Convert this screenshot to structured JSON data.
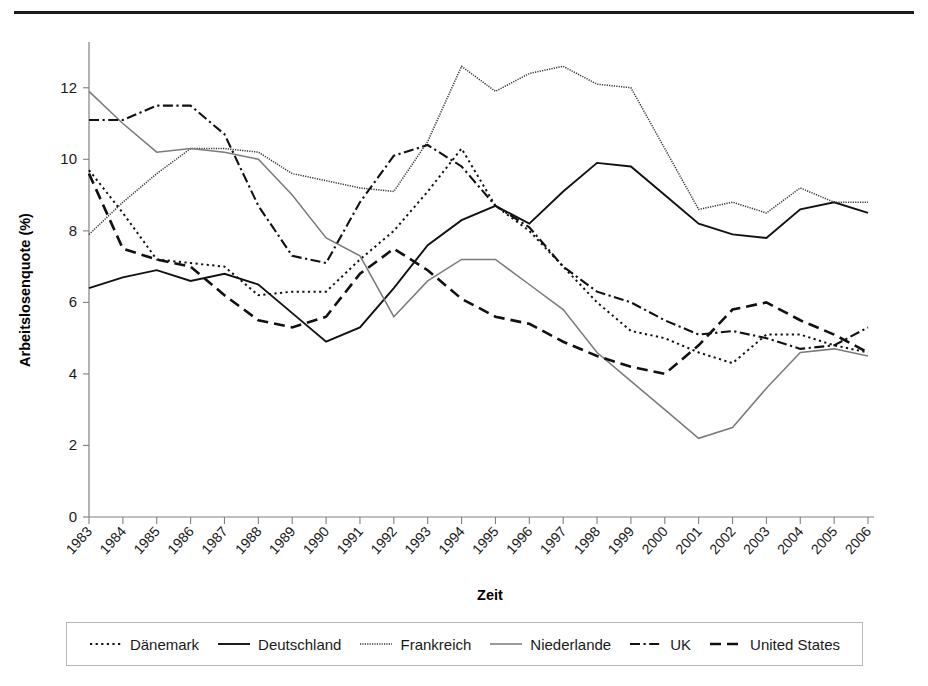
{
  "axis": {
    "ylabel": "Arbeitslosenquote (%)",
    "xlabel": "Zeit",
    "yticks": [
      "0",
      "2",
      "4",
      "6",
      "8",
      "10",
      "12"
    ],
    "xticks": [
      "1983",
      "1984",
      "1985",
      "1986",
      "1987",
      "1988",
      "1989",
      "1990",
      "1991",
      "1992",
      "1993",
      "1994",
      "1995",
      "1996",
      "1997",
      "1998",
      "1999",
      "2000",
      "2001",
      "2002",
      "2003",
      "2004",
      "2005",
      "2006"
    ]
  },
  "legend": {
    "items": [
      {
        "label": "Dänemark",
        "style": "dotted",
        "color": "#111111"
      },
      {
        "label": "Deutschland",
        "style": "solid",
        "color": "#111111"
      },
      {
        "label": "Frankreich",
        "style": "fine-dot",
        "color": "#333333"
      },
      {
        "label": "Niederlande",
        "style": "fine-gray",
        "color": "#7a7a7a"
      },
      {
        "label": "UK",
        "style": "dash-dot",
        "color": "#111111"
      },
      {
        "label": "United States",
        "style": "dashed",
        "color": "#111111"
      }
    ]
  },
  "chart_data": {
    "type": "line",
    "title": "",
    "xlabel": "Zeit",
    "ylabel": "Arbeitslosenquote (%)",
    "ylim": [
      0,
      13
    ],
    "xlim": [
      "1983",
      "2006"
    ],
    "grid": false,
    "legend_position": "bottom",
    "x": [
      "1983",
      "1984",
      "1985",
      "1986",
      "1987",
      "1988",
      "1989",
      "1990",
      "1991",
      "1992",
      "1993",
      "1994",
      "1995",
      "1996",
      "1997",
      "1998",
      "1999",
      "2000",
      "2001",
      "2002",
      "2003",
      "2004",
      "2005",
      "2006"
    ],
    "series": [
      {
        "name": "Dänemark",
        "style": "dotted",
        "color": "#111111",
        "values": [
          9.7,
          8.5,
          7.2,
          7.1,
          7.0,
          6.2,
          6.3,
          6.3,
          7.2,
          8.0,
          9.1,
          10.3,
          8.7,
          8.0,
          7.0,
          6.0,
          5.2,
          5.0,
          4.6,
          4.3,
          5.1,
          5.1,
          4.8,
          4.6
        ]
      },
      {
        "name": "Deutschland",
        "style": "solid",
        "color": "#111111",
        "values": [
          6.4,
          6.7,
          6.9,
          6.6,
          6.8,
          6.5,
          5.7,
          4.9,
          5.3,
          6.4,
          7.6,
          8.3,
          8.7,
          8.2,
          9.1,
          9.9,
          9.8,
          9.0,
          8.2,
          7.9,
          7.8,
          8.6,
          8.8,
          8.5
        ]
      },
      {
        "name": "Frankreich",
        "style": "fine-dot",
        "color": "#333333",
        "values": [
          7.9,
          8.8,
          9.6,
          10.3,
          10.3,
          10.2,
          9.6,
          9.4,
          9.2,
          9.1,
          10.5,
          12.6,
          11.9,
          12.4,
          12.6,
          12.1,
          12.0,
          10.3,
          8.6,
          8.8,
          8.5,
          9.2,
          8.8,
          8.8
        ]
      },
      {
        "name": "Niederlande",
        "style": "fine-gray",
        "color": "#7a7a7a",
        "values": [
          11.9,
          11.0,
          10.2,
          10.3,
          10.2,
          10.0,
          9.0,
          7.8,
          7.3,
          5.6,
          6.6,
          7.2,
          7.2,
          6.5,
          5.8,
          4.6,
          3.8,
          3.0,
          2.2,
          2.5,
          3.6,
          4.6,
          4.7,
          4.5
        ]
      },
      {
        "name": "UK",
        "style": "dash-dot",
        "color": "#111111",
        "values": [
          11.1,
          11.1,
          11.5,
          11.5,
          10.7,
          8.7,
          7.3,
          7.1,
          8.8,
          10.1,
          10.4,
          9.8,
          8.7,
          8.1,
          7.0,
          6.3,
          6.0,
          5.5,
          5.1,
          5.2,
          5.0,
          4.7,
          4.8,
          5.3
        ]
      },
      {
        "name": "United States",
        "style": "dashed",
        "color": "#111111",
        "values": [
          9.6,
          7.5,
          7.2,
          7.0,
          6.2,
          5.5,
          5.3,
          5.6,
          6.8,
          7.5,
          6.9,
          6.1,
          5.6,
          5.4,
          4.9,
          4.5,
          4.2,
          4.0,
          4.8,
          5.8,
          6.0,
          5.5,
          5.1,
          4.6
        ]
      }
    ]
  }
}
